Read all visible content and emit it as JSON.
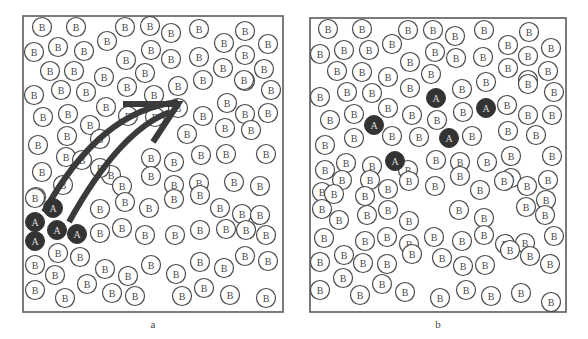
{
  "figure": {
    "colors": {
      "frame": "#5a5a5a",
      "b_atom_stroke": "#4a4a4a",
      "a_atom_fill": "#333333",
      "arrow": "#3a3a3a"
    },
    "atom_labels": {
      "host": "B",
      "solute": "A"
    },
    "atom_radius": 9.5
  },
  "panels": [
    {
      "id": "a",
      "label": "a",
      "frame": {
        "x": 23,
        "y": 16,
        "w": 260,
        "h": 296
      },
      "a_atoms": [
        [
          53,
          208
        ],
        [
          35,
          222
        ],
        [
          57,
          230
        ],
        [
          77,
          234
        ],
        [
          35,
          241
        ]
      ],
      "b_atoms": [
        [
          42,
          27
        ],
        [
          76,
          27
        ],
        [
          125,
          27
        ],
        [
          150,
          26
        ],
        [
          171,
          33
        ],
        [
          199,
          29
        ],
        [
          245,
          31
        ],
        [
          34,
          52
        ],
        [
          58,
          47
        ],
        [
          84,
          51
        ],
        [
          107,
          41
        ],
        [
          151,
          50
        ],
        [
          171,
          59
        ],
        [
          199,
          57
        ],
        [
          224,
          43
        ],
        [
          245,
          55
        ],
        [
          268,
          44
        ],
        [
          50,
          71
        ],
        [
          74,
          71
        ],
        [
          104,
          77
        ],
        [
          126,
          60
        ],
        [
          145,
          73
        ],
        [
          223,
          68
        ],
        [
          245,
          81
        ],
        [
          264,
          69
        ],
        [
          34,
          95
        ],
        [
          61,
          90
        ],
        [
          86,
          92
        ],
        [
          127,
          87
        ],
        [
          154,
          95
        ],
        [
          178,
          86
        ],
        [
          203,
          80
        ],
        [
          244,
          80
        ],
        [
          271,
          90
        ],
        [
          43,
          117
        ],
        [
          68,
          114
        ],
        [
          90,
          125
        ],
        [
          106,
          107
        ],
        [
          178,
          108
        ],
        [
          203,
          116
        ],
        [
          227,
          103
        ],
        [
          245,
          114
        ],
        [
          268,
          113
        ],
        [
          38,
          145
        ],
        [
          67,
          136
        ],
        [
          100,
          139
        ],
        [
          128,
          116
        ],
        [
          155,
          117
        ],
        [
          187,
          134
        ],
        [
          225,
          128
        ],
        [
          251,
          130
        ],
        [
          42,
          172
        ],
        [
          66,
          157
        ],
        [
          82,
          160
        ],
        [
          111,
          175
        ],
        [
          151,
          158
        ],
        [
          174,
          162
        ],
        [
          201,
          155
        ],
        [
          226,
          154
        ],
        [
          266,
          154
        ],
        [
          36,
          197
        ],
        [
          63,
          185
        ],
        [
          100,
          168
        ],
        [
          122,
          186
        ],
        [
          151,
          176
        ],
        [
          174,
          185
        ],
        [
          199,
          183
        ],
        [
          234,
          182
        ],
        [
          260,
          186
        ],
        [
          35,
          198
        ],
        [
          100,
          209
        ],
        [
          125,
          202
        ],
        [
          149,
          208
        ],
        [
          174,
          199
        ],
        [
          200,
          195
        ],
        [
          220,
          208
        ],
        [
          242,
          214
        ],
        [
          260,
          215
        ],
        [
          100,
          233
        ],
        [
          122,
          228
        ],
        [
          145,
          235
        ],
        [
          175,
          235
        ],
        [
          200,
          230
        ],
        [
          226,
          229
        ],
        [
          246,
          230
        ],
        [
          266,
          235
        ],
        [
          35,
          265
        ],
        [
          58,
          253
        ],
        [
          80,
          257
        ],
        [
          105,
          269
        ],
        [
          128,
          276
        ],
        [
          151,
          265
        ],
        [
          176,
          274
        ],
        [
          200,
          262
        ],
        [
          224,
          268
        ],
        [
          245,
          256
        ],
        [
          268,
          261
        ],
        [
          35,
          290
        ],
        [
          55,
          275
        ],
        [
          65,
          298
        ],
        [
          87,
          284
        ],
        [
          112,
          293
        ],
        [
          135,
          296
        ],
        [
          182,
          296
        ],
        [
          204,
          288
        ],
        [
          230,
          295
        ],
        [
          266,
          298
        ]
      ],
      "arrow": {
        "outer_path": "M 44 212 Q 100 110 178 102",
        "inner_path": "M 69 222 Q 120 130 170 112",
        "head": "M 123 104 L 178 104 L 153 142"
      }
    },
    {
      "id": "b",
      "label": "b",
      "frame": {
        "x": 310,
        "y": 18,
        "w": 256,
        "h": 294
      },
      "a_atoms": [
        [
          436,
          98
        ],
        [
          486,
          108
        ],
        [
          374,
          125
        ],
        [
          449,
          138
        ],
        [
          395,
          161
        ]
      ],
      "b_atoms": [
        [
          328,
          29
        ],
        [
          362,
          29
        ],
        [
          408,
          30
        ],
        [
          433,
          30
        ],
        [
          455,
          36
        ],
        [
          484,
          30
        ],
        [
          529,
          32
        ],
        [
          320,
          54
        ],
        [
          344,
          50
        ],
        [
          369,
          50
        ],
        [
          392,
          44
        ],
        [
          435,
          52
        ],
        [
          456,
          58
        ],
        [
          483,
          57
        ],
        [
          508,
          45
        ],
        [
          528,
          56
        ],
        [
          551,
          48
        ],
        [
          337,
          71
        ],
        [
          362,
          72
        ],
        [
          388,
          77
        ],
        [
          410,
          62
        ],
        [
          431,
          74
        ],
        [
          508,
          68
        ],
        [
          528,
          80
        ],
        [
          548,
          71
        ],
        [
          320,
          97
        ],
        [
          347,
          92
        ],
        [
          372,
          93
        ],
        [
          410,
          88
        ],
        [
          462,
          89
        ],
        [
          486,
          82
        ],
        [
          528,
          84
        ],
        [
          554,
          92
        ],
        [
          330,
          120
        ],
        [
          354,
          114
        ],
        [
          388,
          108
        ],
        [
          412,
          115
        ],
        [
          437,
          120
        ],
        [
          463,
          112
        ],
        [
          507,
          105
        ],
        [
          528,
          115
        ],
        [
          552,
          115
        ],
        [
          325,
          145
        ],
        [
          354,
          138
        ],
        [
          392,
          136
        ],
        [
          419,
          137
        ],
        [
          472,
          136
        ],
        [
          508,
          131
        ],
        [
          536,
          135
        ],
        [
          325,
          170
        ],
        [
          346,
          163
        ],
        [
          372,
          166
        ],
        [
          436,
          160
        ],
        [
          460,
          162
        ],
        [
          487,
          162
        ],
        [
          511,
          156
        ],
        [
          552,
          156
        ],
        [
          322,
          192
        ],
        [
          342,
          180
        ],
        [
          370,
          180
        ],
        [
          408,
          170
        ],
        [
          460,
          176
        ],
        [
          511,
          178
        ],
        [
          548,
          180
        ],
        [
          334,
          194
        ],
        [
          365,
          196
        ],
        [
          388,
          189
        ],
        [
          409,
          181
        ],
        [
          435,
          186
        ],
        [
          480,
          190
        ],
        [
          504,
          181
        ],
        [
          527,
          186
        ],
        [
          546,
          200
        ],
        [
          322,
          209
        ],
        [
          339,
          220
        ],
        [
          367,
          215
        ],
        [
          388,
          210
        ],
        [
          409,
          221
        ],
        [
          459,
          210
        ],
        [
          484,
          218
        ],
        [
          526,
          207
        ],
        [
          545,
          215
        ],
        [
          324,
          238
        ],
        [
          365,
          241
        ],
        [
          387,
          237
        ],
        [
          409,
          244
        ],
        [
          434,
          237
        ],
        [
          462,
          241
        ],
        [
          484,
          235
        ],
        [
          505,
          244
        ],
        [
          525,
          243
        ],
        [
          554,
          236
        ],
        [
          320,
          262
        ],
        [
          344,
          255
        ],
        [
          363,
          263
        ],
        [
          387,
          264
        ],
        [
          412,
          254
        ],
        [
          442,
          258
        ],
        [
          463,
          266
        ],
        [
          485,
          265
        ],
        [
          510,
          250
        ],
        [
          530,
          256
        ],
        [
          550,
          264
        ],
        [
          320,
          290
        ],
        [
          343,
          278
        ],
        [
          360,
          295
        ],
        [
          382,
          284
        ],
        [
          405,
          292
        ],
        [
          440,
          298
        ],
        [
          466,
          290
        ],
        [
          491,
          296
        ],
        [
          521,
          293
        ],
        [
          551,
          302
        ]
      ]
    }
  ]
}
